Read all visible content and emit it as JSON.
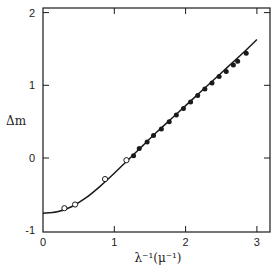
{
  "chart_data": {
    "type": "scatter",
    "title": "",
    "xlabel": "λ⁻¹(μ⁻¹)",
    "ylabel": "Δm",
    "xlim": [
      0,
      3.15
    ],
    "ylim": [
      -1,
      2.08
    ],
    "x_ticks": [
      0,
      1,
      2,
      3
    ],
    "x_tick_labels": [
      "0",
      "1",
      "2",
      "3"
    ],
    "y_ticks": [
      -1,
      0,
      1,
      2
    ],
    "y_tick_labels": [
      "-1",
      "0",
      "1",
      "2"
    ],
    "grid": false,
    "legend": null,
    "series": [
      {
        "name": "open circles",
        "marker": "open-circle",
        "x": [
          0.3,
          0.45,
          0.87,
          1.17
        ],
        "y": [
          -0.69,
          -0.64,
          -0.29,
          -0.03
        ]
      },
      {
        "name": "filled circles",
        "marker": "filled-circle",
        "x": [
          1.27,
          1.35,
          1.46,
          1.55,
          1.66,
          1.77,
          1.87,
          1.97,
          2.07,
          2.17,
          2.27,
          2.37,
          2.47,
          2.57,
          2.67,
          2.73,
          2.85
        ],
        "y": [
          0.03,
          0.13,
          0.22,
          0.31,
          0.4,
          0.5,
          0.59,
          0.68,
          0.77,
          0.86,
          0.95,
          1.03,
          1.12,
          1.19,
          1.28,
          1.33,
          1.44
        ]
      },
      {
        "name": "fitted curve",
        "marker": "line",
        "x": [
          0.0,
          0.2,
          0.4,
          0.6,
          0.8,
          1.0,
          1.2,
          1.4,
          1.6,
          1.8,
          2.0,
          2.2,
          2.4,
          2.6,
          2.8,
          3.0
        ],
        "y": [
          -0.76,
          -0.74,
          -0.67,
          -0.55,
          -0.39,
          -0.21,
          -0.02,
          0.17,
          0.36,
          0.54,
          0.72,
          0.9,
          1.08,
          1.26,
          1.44,
          1.63
        ]
      }
    ]
  }
}
